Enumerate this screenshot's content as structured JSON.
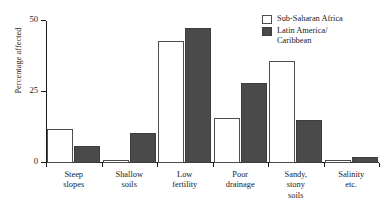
{
  "chart_data": {
    "type": "bar",
    "title": "",
    "subtitle": "",
    "xlabel": "",
    "ylabel": "Percentage affected",
    "ylim": [
      0,
      50
    ],
    "yticks": [
      0,
      25,
      50
    ],
    "ytick_labels": [
      "0",
      "25",
      "50"
    ],
    "grid": false,
    "legend_position": "top-right",
    "categories": [
      "Steep\nslopes",
      "Shallow\nsoils",
      "Low\nfertility",
      "Poor\ndrainage",
      "Sandy,\nstony\nsoils",
      "Salinity\netc."
    ],
    "series": [
      {
        "name": "Sub-Saharan Africa",
        "style": "open",
        "color": "#ffffff",
        "edge_color": "#4d4d4d",
        "values": [
          12,
          1,
          43,
          16,
          36,
          1
        ]
      },
      {
        "name": "Latin America/\nCaribbean",
        "style": "filled",
        "color": "#4a4a4a",
        "edge_color": "#3d3d3d",
        "values": [
          6,
          10.5,
          47.5,
          28,
          15,
          2
        ]
      }
    ]
  },
  "legend": {
    "items": [
      {
        "label": "Sub-Saharan Africa",
        "swatch": "open"
      },
      {
        "label": "Latin America/\nCaribbean",
        "swatch": "filled"
      }
    ]
  }
}
